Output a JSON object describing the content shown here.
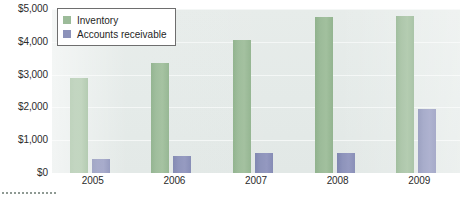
{
  "chart_data": {
    "type": "bar",
    "title": "",
    "subtitle": "",
    "xlabel": "",
    "ylabel": "",
    "categories": [
      "2005",
      "2006",
      "2007",
      "2008",
      "2009"
    ],
    "series": [
      {
        "name": "Inventory",
        "color": "#9cbb99",
        "values": [
          2900,
          3350,
          4050,
          4750,
          4800
        ]
      },
      {
        "name": "Accounts receivable",
        "color": "#8c92ba",
        "values": [
          420,
          510,
          620,
          600,
          1950
        ]
      }
    ],
    "ylim": [
      0,
      5000
    ],
    "ytick_values": [
      0,
      1000,
      2000,
      3000,
      4000,
      5000
    ],
    "ytick_labels": [
      "$0",
      "$1,000",
      "$2,000",
      "$3,000",
      "$4,000",
      "$5,000"
    ],
    "grid": true,
    "legend_position": "top-left",
    "annotations": []
  },
  "legend": {
    "items": [
      {
        "label": "Inventory",
        "swatch_icon": "square-swatch-green"
      },
      {
        "label": "Accounts receivable",
        "swatch_icon": "square-swatch-blue"
      }
    ]
  }
}
